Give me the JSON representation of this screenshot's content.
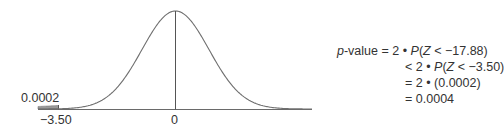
{
  "chart_data": {
    "type": "area",
    "title": "",
    "xlabel": "",
    "ylabel": "",
    "tick_labels": [
      "-3.50",
      "0"
    ],
    "x_ticks": [
      -3.5,
      0
    ],
    "shaded_region": {
      "from": "-inf",
      "to": -3.5,
      "area": 0.0002
    },
    "annotations": [
      "0.0002"
    ],
    "grid": false,
    "legend": null
  },
  "curve": {
    "shaded_area_label": "0.0002",
    "left_tick_label": "−3.50",
    "center_tick_label": "0"
  },
  "formula": {
    "lines": [
      {
        "lhs_italic": "p",
        "lhs_rest": "-value",
        "op": "=",
        "pre": "2 • ",
        "fn": "P",
        "arg_open": "(",
        "var": "Z",
        "arg_rest": " < −17.88)"
      },
      {
        "op": "<",
        "pre": "2 • ",
        "fn": "P",
        "arg_open": "(",
        "var": "Z",
        "arg_rest": " < −3.50)"
      },
      {
        "op": "=",
        "text": "2 • (0.0002)"
      },
      {
        "op": "=",
        "text": "0.0004"
      }
    ]
  },
  "colors": {
    "curve": "#6f6f6f",
    "axis": "#6a6a6a",
    "shade": "#9a9a9a",
    "text": "#333333"
  }
}
